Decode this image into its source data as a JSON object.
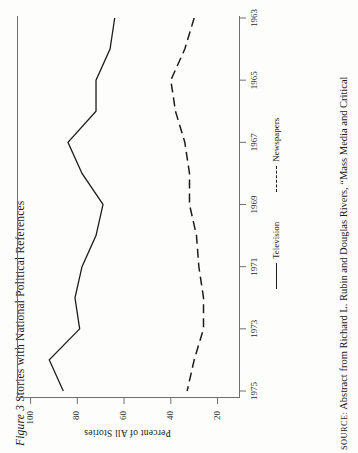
{
  "figure": {
    "number_label": "Figure 3",
    "title": "Stories with National Political References",
    "source_prefix": "SOURCE:",
    "source_text": "Abstract from Richard L. Rubin and Douglas Rivers, “Mass Media and Critical"
  },
  "axes": {
    "value_axis_label": "Percent of All Stories",
    "value_ticks": [
      "100",
      "80",
      "60",
      "40",
      "20"
    ],
    "value_tick_numbers": [
      100,
      80,
      60,
      40,
      20
    ],
    "year_ticks": [
      "1963",
      "1965",
      "1967",
      "1969",
      "1971",
      "1973",
      "1975"
    ],
    "year_tick_numbers": [
      1963,
      1965,
      1967,
      1969,
      1971,
      1973,
      1975
    ]
  },
  "legend": {
    "items": [
      {
        "label": "Television",
        "style": "solid"
      },
      {
        "label": "Newspapers",
        "style": "dashed"
      }
    ]
  },
  "chart_data": {
    "type": "line",
    "title": "Figure 3 Stories with National Political References",
    "orientation": "rotated-90-ccw",
    "xlabel": "",
    "ylabel": "Percent of All Stories",
    "xlim": [
      1963,
      1975
    ],
    "ylim": [
      10,
      105
    ],
    "grid": false,
    "legend_position": "below-axis",
    "x": [
      1963,
      1964,
      1965,
      1966,
      1967,
      1968,
      1969,
      1970,
      1971,
      1972,
      1973,
      1974,
      1975
    ],
    "series": [
      {
        "name": "Television",
        "style": "solid",
        "values": [
          64,
          66,
          72,
          72,
          84,
          78,
          69,
          72,
          78,
          81,
          79,
          92,
          86
        ]
      },
      {
        "name": "Newspapers",
        "style": "dashed",
        "values": [
          30,
          34,
          40,
          38,
          34,
          32,
          32,
          29,
          28,
          26,
          26,
          30,
          33
        ]
      }
    ]
  }
}
